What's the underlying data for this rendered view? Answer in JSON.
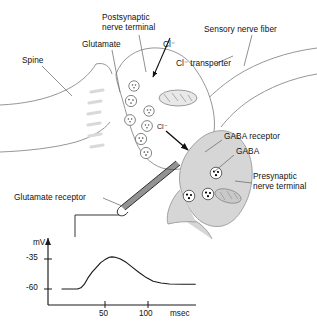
{
  "figure": {
    "title_present": false,
    "colors": {
      "outline": "#8a8a8a",
      "cell_fill": "#ffffff",
      "presynaptic_fill": "#d6d6d6",
      "mitochondria_fill": "#e2e2e2",
      "vesicle_stroke": "#6f6f6f",
      "gaba_dot": "#000000",
      "receptor_band": "#d9d9d9",
      "electrode": "#2b2b2b",
      "trace": "#1a1a1a",
      "axis": "#1a1a1a"
    }
  },
  "labels": {
    "spine": "Spine",
    "glutamate": "Glutamate",
    "postsynaptic_terminal": "Postsynaptic\nnerve terminal",
    "chloride": "Cl⁻",
    "chloride_transporter": "Cl⁻ transporter",
    "sensory_nerve_fiber": "Sensory nerve fiber",
    "gaba_receptor": "GABA receptor",
    "gaba": "GABA",
    "presynaptic_terminal": "Presynaptic\nnerve terminal",
    "glutamate_receptor": "Glutamate receptor",
    "cleft_chloride": "Cl⁻"
  },
  "chart_data": {
    "type": "line",
    "title": "",
    "xlabel": "msec",
    "ylabel": "mV",
    "x": [
      0,
      12,
      18,
      22,
      26,
      30,
      35,
      40,
      45,
      50,
      55,
      58,
      62,
      68,
      75,
      82,
      90,
      98,
      106,
      115,
      125,
      140,
      155
    ],
    "y": [
      -60,
      -60,
      -60,
      -59,
      -56,
      -51,
      -46,
      -42,
      -38,
      -35.5,
      -33.5,
      -33.2,
      -33.5,
      -35,
      -38,
      -42,
      -46.5,
      -50.5,
      -53.5,
      -55,
      -55.8,
      -56,
      -56
    ],
    "xlim": [
      0,
      165
    ],
    "ylim": [
      -72,
      -26
    ],
    "xticks": [
      50,
      100
    ],
    "xtick_labels": [
      "50",
      "100"
    ],
    "yticks": [
      -35,
      -60
    ],
    "ytick_labels": [
      "-35",
      "-60"
    ],
    "grid": false,
    "legend": null,
    "series": [
      {
        "name": "membrane potential",
        "baseline_mV": -60,
        "peak_mV": -33,
        "peak_time_msec": 58,
        "plateau_mV": -56
      }
    ]
  }
}
